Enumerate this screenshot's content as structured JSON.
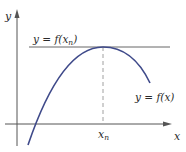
{
  "figure": {
    "colors": {
      "axis": "#555555",
      "curve": "#3f4a8a",
      "tangent": "#555555",
      "dashed": "#9a9a9a",
      "text": "#2a2a2a"
    },
    "labels": {
      "y_axis": "y",
      "x_axis": "x",
      "tangent_line": "y = f(x",
      "tangent_sub": "n",
      "tangent_close": ")",
      "curve": "y = f(x)",
      "xn_main": "x",
      "xn_sub": "n"
    }
  }
}
